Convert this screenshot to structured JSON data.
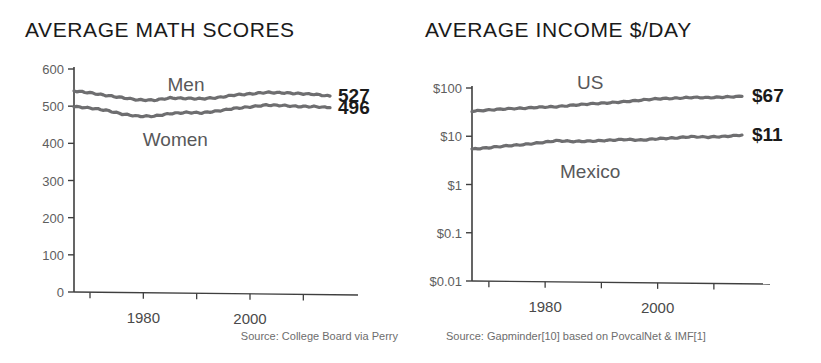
{
  "colors": {
    "line": "#6e6e70",
    "axis": "#3f3f3f",
    "title_text": "#1a1a1a",
    "tick_text": "#5e5e5e",
    "series_label_text": "#58585a",
    "source_text": "#6d6d6d",
    "background": "#ffffff"
  },
  "chart_data": [
    {
      "type": "line",
      "title": "AVERAGE MATH SCORES",
      "xlabel": "",
      "ylabel": "",
      "grid": false,
      "legend_position": "inline-annotations",
      "source": "Source: College Board via Perry",
      "ylim": [
        0,
        600
      ],
      "yticks": [
        0,
        100,
        200,
        300,
        400,
        500,
        600
      ],
      "ytick_labels": [
        "0",
        "100",
        "200",
        "300",
        "400",
        "500",
        "600"
      ],
      "xlim": [
        1967,
        2015
      ],
      "xticks": [
        1970,
        1980,
        1990,
        2000,
        2010
      ],
      "xtick_labels": [
        "",
        "1980",
        "",
        "2000",
        ""
      ],
      "x": [
        1967,
        1970,
        1973,
        1976,
        1979,
        1982,
        1985,
        1988,
        1991,
        1994,
        1997,
        2000,
        2003,
        2006,
        2009,
        2012,
        2015
      ],
      "series": [
        {
          "name": "Men",
          "label_x": 1988,
          "end_value_label": "527",
          "values": [
            541,
            536,
            529,
            523,
            517,
            516,
            522,
            521,
            520,
            523,
            530,
            533,
            537,
            536,
            534,
            532,
            527
          ]
        },
        {
          "name": "Women",
          "label_x": 1986,
          "end_value_label": "496",
          "values": [
            499,
            495,
            489,
            479,
            473,
            473,
            480,
            483,
            482,
            487,
            494,
            498,
            503,
            502,
            499,
            499,
            496
          ]
        }
      ]
    },
    {
      "type": "line",
      "title": "AVERAGE INCOME $/DAY",
      "xlabel": "",
      "ylabel": "",
      "grid": false,
      "yscale": "log",
      "legend_position": "inline-annotations",
      "source": "Source: Gapminder[10] based on PovcalNet & IMF[1]",
      "ylim": [
        0.01,
        100
      ],
      "yticks": [
        0.01,
        0.1,
        1,
        10,
        100
      ],
      "ytick_labels": [
        "$0.01",
        "$0.1",
        "$1",
        "$10",
        "$100"
      ],
      "xlim": [
        1967,
        2015
      ],
      "xticks": [
        1970,
        1980,
        1990,
        2000,
        2010
      ],
      "xtick_labels": [
        "",
        "1980",
        "",
        "2000",
        ""
      ],
      "x": [
        1967,
        1970,
        1973,
        1976,
        1979,
        1982,
        1985,
        1988,
        1991,
        1994,
        1997,
        2000,
        2003,
        2006,
        2009,
        2012,
        2015
      ],
      "series": [
        {
          "name": "US",
          "label_x": 1988,
          "end_value_label": "$67",
          "values": [
            33,
            35,
            37,
            38,
            40,
            41,
            44,
            47,
            49,
            52,
            56,
            60,
            61,
            64,
            63,
            65,
            67
          ]
        },
        {
          "name": "Mexico",
          "label_x": 1988,
          "end_value_label": "$11",
          "values": [
            5.4,
            5.8,
            6.3,
            6.7,
            7.3,
            8.1,
            7.8,
            7.9,
            8.2,
            8.6,
            8.3,
            8.9,
            9.2,
            9.8,
            9.6,
            9.9,
            10.6
          ]
        }
      ]
    }
  ]
}
